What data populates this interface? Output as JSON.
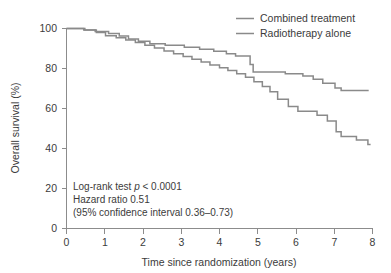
{
  "chart_data": {
    "type": "line",
    "title": "",
    "xlabel": "Time since randomization (years)",
    "ylabel": "Overall survival (%)",
    "xlim": [
      0,
      8
    ],
    "ylim": [
      0,
      100
    ],
    "xticks": [
      "0",
      "1",
      "2",
      "3",
      "4",
      "5",
      "6",
      "7",
      "8"
    ],
    "yticks": [
      "0",
      "20",
      "40",
      "60",
      "80",
      "100"
    ],
    "grid": false,
    "legend_position": "top-right",
    "line_color": "#8a8a8a",
    "axis_color": "#8c8c8c",
    "series": [
      {
        "name": "Combined treatment",
        "step": "post",
        "points": [
          [
            0.0,
            100.0
          ],
          [
            0.3,
            100.0
          ],
          [
            0.45,
            99.3
          ],
          [
            0.62,
            99.3
          ],
          [
            0.75,
            98.5
          ],
          [
            0.95,
            98.5
          ],
          [
            1.1,
            97.5
          ],
          [
            1.28,
            97.5
          ],
          [
            1.38,
            96.2
          ],
          [
            1.52,
            96.2
          ],
          [
            1.62,
            94.8
          ],
          [
            1.78,
            94.8
          ],
          [
            1.88,
            93.6
          ],
          [
            2.05,
            93.6
          ],
          [
            2.18,
            92.4
          ],
          [
            2.45,
            92.4
          ],
          [
            2.58,
            91.6
          ],
          [
            2.95,
            91.6
          ],
          [
            3.08,
            90.6
          ],
          [
            3.35,
            90.6
          ],
          [
            3.48,
            89.6
          ],
          [
            3.72,
            89.6
          ],
          [
            3.85,
            88.6
          ],
          [
            4.05,
            88.6
          ],
          [
            4.18,
            87.4
          ],
          [
            4.32,
            87.4
          ],
          [
            4.42,
            86.2
          ],
          [
            4.72,
            86.2
          ],
          [
            4.8,
            82.0
          ],
          [
            4.88,
            78.2
          ],
          [
            5.6,
            78.2
          ],
          [
            5.72,
            77.4
          ],
          [
            6.05,
            77.4
          ],
          [
            6.18,
            76.2
          ],
          [
            6.35,
            76.2
          ],
          [
            6.45,
            74.6
          ],
          [
            6.6,
            74.6
          ],
          [
            6.7,
            72.6
          ],
          [
            6.92,
            72.6
          ],
          [
            7.02,
            70.2
          ],
          [
            7.18,
            69.0
          ],
          [
            7.9,
            69.0
          ]
        ]
      },
      {
        "name": "Radiotherapy alone",
        "step": "post",
        "points": [
          [
            0.0,
            100.0
          ],
          [
            0.32,
            100.0
          ],
          [
            0.48,
            99.2
          ],
          [
            0.65,
            99.2
          ],
          [
            0.78,
            98.0
          ],
          [
            0.92,
            98.0
          ],
          [
            1.02,
            96.4
          ],
          [
            1.18,
            96.4
          ],
          [
            1.3,
            95.4
          ],
          [
            1.45,
            95.4
          ],
          [
            1.55,
            94.2
          ],
          [
            1.7,
            94.2
          ],
          [
            1.8,
            93.0
          ],
          [
            1.95,
            93.0
          ],
          [
            2.05,
            91.6
          ],
          [
            2.2,
            91.6
          ],
          [
            2.3,
            90.2
          ],
          [
            2.45,
            90.2
          ],
          [
            2.55,
            88.8
          ],
          [
            2.7,
            88.8
          ],
          [
            2.8,
            87.4
          ],
          [
            2.95,
            87.4
          ],
          [
            3.05,
            86.0
          ],
          [
            3.18,
            86.0
          ],
          [
            3.28,
            84.6
          ],
          [
            3.42,
            84.6
          ],
          [
            3.52,
            83.2
          ],
          [
            3.65,
            83.2
          ],
          [
            3.75,
            81.8
          ],
          [
            3.9,
            81.8
          ],
          [
            4.0,
            80.4
          ],
          [
            4.12,
            80.4
          ],
          [
            4.22,
            79.0
          ],
          [
            4.35,
            79.0
          ],
          [
            4.45,
            77.4
          ],
          [
            4.58,
            77.4
          ],
          [
            4.68,
            75.6
          ],
          [
            4.8,
            75.6
          ],
          [
            4.9,
            73.4
          ],
          [
            5.02,
            73.4
          ],
          [
            5.12,
            71.0
          ],
          [
            5.22,
            71.0
          ],
          [
            5.32,
            68.4
          ],
          [
            5.42,
            68.4
          ],
          [
            5.52,
            64.6
          ],
          [
            5.7,
            64.6
          ],
          [
            5.8,
            61.0
          ],
          [
            5.95,
            61.0
          ],
          [
            6.05,
            58.6
          ],
          [
            6.45,
            58.6
          ],
          [
            6.55,
            56.6
          ],
          [
            6.72,
            56.6
          ],
          [
            6.82,
            53.8
          ],
          [
            6.95,
            53.8
          ],
          [
            7.05,
            48.4
          ],
          [
            7.18,
            46.0
          ],
          [
            7.45,
            46.0
          ],
          [
            7.58,
            44.2
          ],
          [
            7.8,
            44.2
          ],
          [
            7.88,
            42.0
          ],
          [
            7.95,
            42.0
          ]
        ]
      }
    ],
    "annotations": [
      {
        "prefix": "Log-rank test ",
        "italic": "p",
        "suffix": " < 0.0001"
      },
      {
        "prefix": "Hazard ratio 0.51",
        "italic": "",
        "suffix": ""
      },
      {
        "prefix": "(95% confidence interval 0.36–0.73)",
        "italic": "",
        "suffix": ""
      }
    ]
  }
}
